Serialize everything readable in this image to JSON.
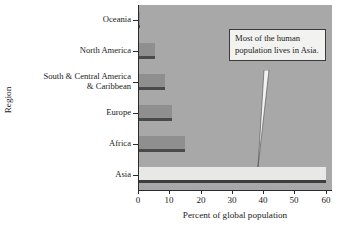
{
  "chart_data": {
    "type": "bar",
    "orientation": "horizontal",
    "title": "",
    "xlabel": "Percent of global population",
    "ylabel": "Region",
    "categories": [
      "Oceania",
      "North America",
      "South & Central America & Caribbean",
      "Europe",
      "Africa",
      "Asia"
    ],
    "values": [
      0.5,
      5.5,
      8.5,
      11,
      15,
      60
    ],
    "xlim": [
      0,
      62
    ],
    "xticks": [
      0,
      10,
      20,
      30,
      40,
      50,
      60
    ],
    "xtick_labels": [
      "0",
      "10",
      "20",
      "30",
      "40",
      "50",
      "60"
    ],
    "grid": false,
    "legend": null,
    "annotations": [
      {
        "text": "Most of the human population lives in Asia.",
        "points_to": "Asia"
      }
    ]
  },
  "axis": {
    "x_title": "Percent of global population",
    "y_title": "Region"
  },
  "categories": [
    {
      "label_line1": "Oceania",
      "label_line2": ""
    },
    {
      "label_line1": "North America",
      "label_line2": ""
    },
    {
      "label_line1": "South & Central America",
      "label_line2": "& Caribbean"
    },
    {
      "label_line1": "Europe",
      "label_line2": ""
    },
    {
      "label_line1": "Africa",
      "label_line2": ""
    },
    {
      "label_line1": "Asia",
      "label_line2": ""
    }
  ],
  "callout": {
    "text": "Most of the human population lives in Asia."
  },
  "colors": {
    "plot_background": "#a8a8a8",
    "bar_fill": "#8f8f8f",
    "bar_highlight_fill": "#e8e8e6",
    "bar_edge": "#4a4a4a",
    "axis": "#2b2b2b",
    "callout_background": "#f2f2f0"
  }
}
